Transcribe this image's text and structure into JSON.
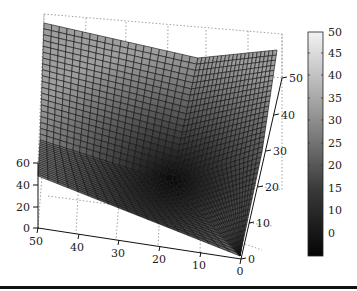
{
  "chart_data": {
    "type": "surface3d",
    "title": "",
    "xlabel": "",
    "ylabel": "",
    "zlabel": "",
    "x_ticks": [
      50,
      40,
      30,
      20,
      10,
      0
    ],
    "y_ticks": [
      0,
      10,
      20,
      30,
      40,
      50
    ],
    "z_ticks": [
      0,
      20,
      40,
      60
    ],
    "xlim": [
      0,
      50
    ],
    "ylim": [
      0,
      50
    ],
    "zlim": [
      0,
      60
    ],
    "colorbar": {
      "ticks": [
        50,
        45,
        40,
        35,
        30,
        25,
        20,
        15,
        10,
        0
      ],
      "range": [
        -5,
        50
      ],
      "colormap": "grayscale (black low, white high)"
    },
    "grid": true,
    "surface_description": "V/valley-shaped surface with minimum (~0) near x=15,y=25 rising to ~50 at far corners; creases along x≈15 and y≈25",
    "corner_values": {
      "x50_y0": 50,
      "x0_y0": 0,
      "x50_y50": 55,
      "x0_y50": 50,
      "x15_y25": 0
    }
  },
  "axes": {
    "z_labels": [
      "60",
      "40",
      "20",
      "0"
    ],
    "x_labels": [
      "50",
      "40",
      "30",
      "20",
      "10",
      "0"
    ],
    "y_labels": [
      "0",
      "10",
      "20",
      "30",
      "40",
      "50"
    ]
  },
  "colorbar_labels": [
    "50",
    "45",
    "40",
    "35",
    "30",
    "25",
    "20",
    "15",
    "10",
    "0"
  ]
}
